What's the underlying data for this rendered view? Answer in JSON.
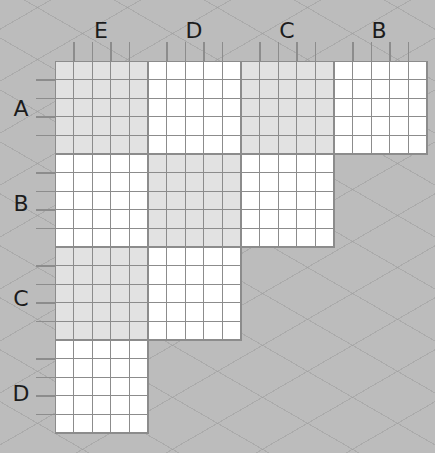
{
  "puzzle": {
    "type": "logic-grid",
    "cells_per_block": 5,
    "column_groups": [
      {
        "label": "E"
      },
      {
        "label": "D"
      },
      {
        "label": "C"
      },
      {
        "label": "B"
      }
    ],
    "row_groups": [
      {
        "label": "A"
      },
      {
        "label": "B"
      },
      {
        "label": "C"
      },
      {
        "label": "D"
      }
    ],
    "blocks": [
      {
        "row": "A",
        "col": "E",
        "shade": "gray"
      },
      {
        "row": "A",
        "col": "D",
        "shade": "white"
      },
      {
        "row": "A",
        "col": "C",
        "shade": "gray"
      },
      {
        "row": "A",
        "col": "B",
        "shade": "white"
      },
      {
        "row": "B",
        "col": "E",
        "shade": "white"
      },
      {
        "row": "B",
        "col": "D",
        "shade": "gray"
      },
      {
        "row": "B",
        "col": "C",
        "shade": "white"
      },
      {
        "row": "C",
        "col": "E",
        "shade": "gray"
      },
      {
        "row": "C",
        "col": "D",
        "shade": "white"
      },
      {
        "row": "D",
        "col": "E",
        "shade": "white"
      }
    ]
  },
  "colors": {
    "background": "#bcbcbc",
    "cell_gray": "#e2e2e2",
    "cell_white": "#ffffff",
    "grid_line": "#8c8c8c",
    "label": "#1c1c1c"
  }
}
